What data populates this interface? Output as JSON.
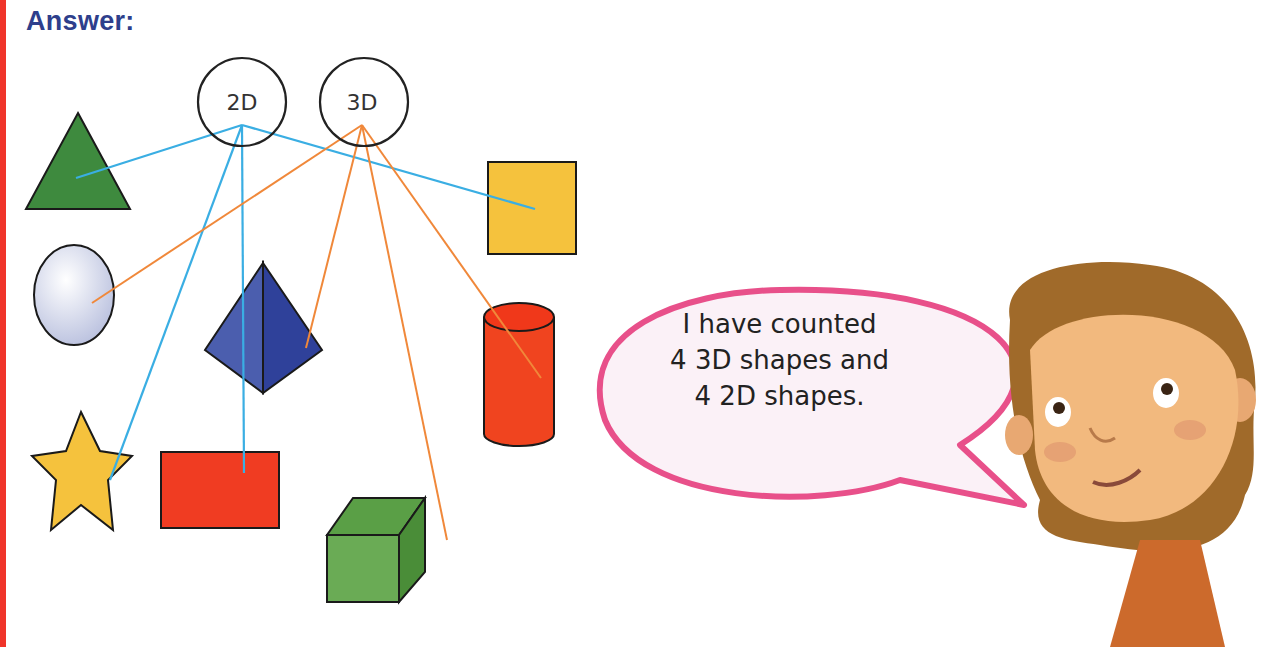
{
  "heading": "Answer:",
  "categories": {
    "two_d": {
      "label": "2D",
      "line_color": "#3aaee3"
    },
    "three_d": {
      "label": "3D",
      "line_color": "#f0883a"
    }
  },
  "shapes": [
    {
      "name": "triangle",
      "category": "2D",
      "color": "#3e8a3e"
    },
    {
      "name": "sphere",
      "category": "3D",
      "color": "#d7dcef"
    },
    {
      "name": "star",
      "category": "2D",
      "color": "#f5c23d"
    },
    {
      "name": "rectangle",
      "category": "2D",
      "color": "#f03c22"
    },
    {
      "name": "pyramid",
      "category": "3D",
      "color": "#34469a"
    },
    {
      "name": "square",
      "category": "2D",
      "color": "#f5c23d"
    },
    {
      "name": "cylinder",
      "category": "3D",
      "color": "#f0441f"
    },
    {
      "name": "cube",
      "category": "3D",
      "color": "#5a9f46"
    }
  ],
  "speech_bubble": {
    "lines": [
      "I have counted",
      "4 3D shapes and",
      "4 2D shapes."
    ],
    "border_color": "#e8508a"
  },
  "character": "girl-illustration"
}
